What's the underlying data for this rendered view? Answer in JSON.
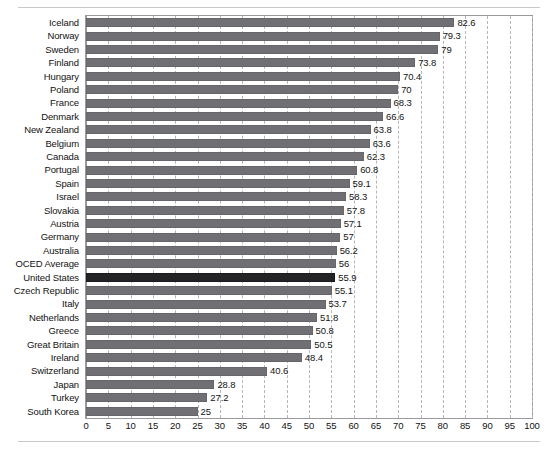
{
  "chart_data": {
    "type": "bar",
    "orientation": "horizontal",
    "title": "",
    "subtitle": "",
    "xlabel": "",
    "ylabel": "",
    "xlim": [
      0,
      100
    ],
    "ylim": null,
    "grid": true,
    "grid_style": "dashed vertical",
    "legend": null,
    "legend_position": "none",
    "xticks": [
      0,
      5,
      10,
      15,
      20,
      25,
      30,
      35,
      40,
      45,
      50,
      55,
      60,
      65,
      70,
      75,
      80,
      85,
      90,
      95,
      100
    ],
    "tick_step": 5,
    "categories": [
      "Iceland",
      "Norway",
      "Sweden",
      "Finland",
      "Hungary",
      "Poland",
      "France",
      "Denmark",
      "New Zealand",
      "Belgium",
      "Canada",
      "Portugal",
      "Spain",
      "Israel",
      "Slovakia",
      "Austria",
      "Germany",
      "Australia",
      "OCED Average",
      "United States",
      "Czech Republic",
      "Italy",
      "Netherlands",
      "Greece",
      "Great Britain",
      "Ireland",
      "Switzerland",
      "Japan",
      "Turkey",
      "South Korea"
    ],
    "values": [
      82.6,
      79.3,
      79,
      73.8,
      70.4,
      70,
      68.3,
      66.6,
      63.8,
      63.6,
      62.3,
      60.8,
      59.1,
      58.3,
      57.8,
      57.1,
      57,
      56.2,
      56,
      55.9,
      55.1,
      53.7,
      51.8,
      50.8,
      50.5,
      48.4,
      40.6,
      28.8,
      27.2,
      25
    ],
    "value_labels": [
      "82.6",
      "79.3",
      "79",
      "73.8",
      "70.4",
      "70",
      "68.3",
      "66.6",
      "63.8",
      "63.6",
      "62.3",
      "60.8",
      "59.1",
      "58.3",
      "57.8",
      "57.1",
      "57",
      "56.2",
      "56",
      "55.9",
      "55.1",
      "53.7",
      "51.8",
      "50.8",
      "50.5",
      "48.4",
      "40.6",
      "28.8",
      "27.2",
      "25"
    ],
    "highlighted_category": "United States",
    "colors": {
      "bar": "#707074",
      "bar_highlight": "#232326",
      "gridline": "#b6b6ba",
      "plot_border": "#9a9a9e",
      "background": "#ffffff",
      "text": "#121212",
      "rule": "#c9c9cc"
    }
  }
}
